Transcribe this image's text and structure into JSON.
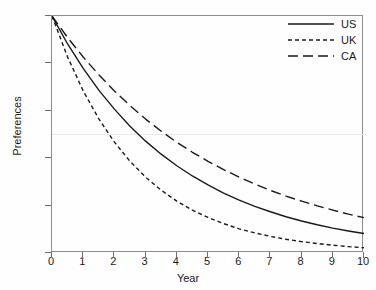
{
  "chart_data": {
    "type": "line",
    "title": "",
    "xlabel": "Year",
    "ylabel": "Preferences",
    "xlim": [
      0,
      10
    ],
    "ylim": [
      0,
      1
    ],
    "grid": false,
    "legend_position": "top-right",
    "xticks": [
      "0",
      "1",
      "2",
      "3",
      "4",
      "5",
      "6",
      "7",
      "8",
      "9",
      "10"
    ],
    "xtick_values": [
      0,
      1,
      2,
      3,
      4,
      5,
      6,
      7,
      8,
      9,
      10
    ],
    "yticks": [
      "0",
      ".2",
      ".4",
      ".6",
      ".8",
      "1"
    ],
    "ytick_values": [
      0,
      0.2,
      0.4,
      0.6,
      0.8,
      1
    ],
    "x": [
      0,
      0.5,
      1,
      1.5,
      2,
      2.5,
      3,
      3.5,
      4,
      4.5,
      5,
      5.5,
      6,
      6.5,
      7,
      7.5,
      8,
      8.5,
      9,
      9.5,
      10
    ],
    "series": [
      {
        "name": "US",
        "dash": "solid",
        "color": "#1a1a1a",
        "values": [
          1.0,
          0.882,
          0.779,
          0.687,
          0.607,
          0.535,
          0.472,
          0.417,
          0.368,
          0.325,
          0.287,
          0.253,
          0.223,
          0.197,
          0.174,
          0.153,
          0.135,
          0.119,
          0.105,
          0.093,
          0.082
        ]
      },
      {
        "name": "UK",
        "dash": "short-dash",
        "color": "#1a1a1a",
        "values": [
          1.0,
          0.827,
          0.684,
          0.566,
          0.468,
          0.387,
          0.32,
          0.265,
          0.219,
          0.181,
          0.15,
          0.124,
          0.102,
          0.085,
          0.07,
          0.058,
          0.048,
          0.04,
          0.033,
          0.027,
          0.022
        ]
      },
      {
        "name": "CA",
        "dash": "long-dash",
        "color": "#1a1a1a",
        "values": [
          1.0,
          0.909,
          0.827,
          0.752,
          0.684,
          0.622,
          0.565,
          0.514,
          0.467,
          0.425,
          0.387,
          0.352,
          0.32,
          0.291,
          0.264,
          0.24,
          0.219,
          0.199,
          0.181,
          0.164,
          0.149
        ]
      }
    ],
    "reference_line": {
      "orientation": "horizontal",
      "value": 0.5,
      "color": "#e8e8e8"
    }
  }
}
